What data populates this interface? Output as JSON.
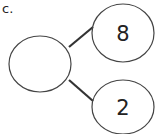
{
  "problem": {
    "label": "c.",
    "whole": "",
    "parts": [
      "8",
      "2"
    ]
  },
  "colors": {
    "stroke": "#444444",
    "line": "#333333",
    "text": "#222222"
  }
}
